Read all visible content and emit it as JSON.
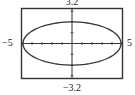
{
  "window": {
    "xmin_label": "−5",
    "xmax_label": "5",
    "ymax_label": "3.2",
    "ymin_label": "−3.2"
  },
  "chart_data": {
    "type": "line",
    "title": "",
    "xlabel": "",
    "ylabel": "",
    "xlim": [
      -5,
      5
    ],
    "ylim": [
      -3.2,
      3.2
    ],
    "xscale": 1,
    "yscale": 1,
    "grid": false,
    "curve": {
      "kind": "ellipse",
      "center": [
        0,
        0
      ],
      "semi_major_x": 5,
      "semi_minor_y": 2,
      "equation": "x^2/25 + y^2/4 = 1"
    },
    "series": [
      {
        "name": "ellipse",
        "x": [
          -5,
          -4,
          -3,
          -2,
          -1,
          0,
          1,
          2,
          3,
          4,
          5
        ],
        "y_upper": [
          0,
          1.2,
          1.6,
          1.83,
          1.96,
          2,
          1.96,
          1.83,
          1.6,
          1.2,
          0
        ],
        "y_lower": [
          0,
          -1.2,
          -1.6,
          -1.83,
          -1.96,
          -2,
          -1.96,
          -1.83,
          -1.6,
          -1.2,
          0
        ]
      }
    ],
    "tick_labels": {
      "x": [
        "−5",
        "5"
      ],
      "y": [
        "−3.2",
        "3.2"
      ]
    }
  },
  "colors": {
    "frame": "#333333",
    "axis": "#333333",
    "curve": "#333333",
    "background": "#ffffff"
  }
}
